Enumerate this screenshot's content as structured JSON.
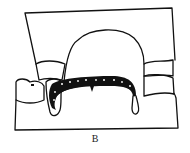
{
  "figure": {
    "label": "B",
    "stroke_color": "#111111",
    "fill_color": "#ffffff"
  }
}
